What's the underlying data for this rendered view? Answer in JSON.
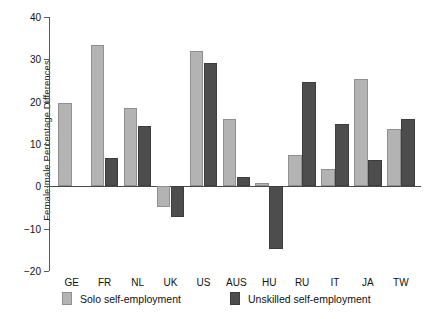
{
  "chart_data": {
    "type": "bar",
    "title": "",
    "xlabel": "",
    "ylabel": "Female-male Percentage Differences",
    "ylim": [
      -20,
      40
    ],
    "yticks": [
      -20,
      -10,
      0,
      10,
      20,
      30,
      40
    ],
    "ytick_labels": [
      "−20",
      "−10",
      "0",
      "10",
      "20",
      "30",
      "40"
    ],
    "grid": false,
    "legend_position": "bottom",
    "categories": [
      "GE",
      "FR",
      "NL",
      "UK",
      "US",
      "AUS",
      "HU",
      "RU",
      "IT",
      "JA",
      "TW"
    ],
    "series": [
      {
        "name": "Solo self-employment",
        "color": "#b3b3b3",
        "values": [
          19.6,
          33.3,
          18.4,
          -5.0,
          32.0,
          15.8,
          0.8,
          7.5,
          4.0,
          25.3,
          13.5
        ]
      },
      {
        "name": "Unskilled self-employment",
        "color": "#4d4d4d",
        "values": [
          0.0,
          6.6,
          14.2,
          -7.3,
          29.2,
          2.1,
          -14.9,
          24.7,
          14.7,
          6.3,
          15.8
        ]
      }
    ]
  },
  "legend": {
    "items": [
      {
        "label": "Solo self-employment",
        "swatch": "light"
      },
      {
        "label": "Unskilled self-employment",
        "swatch": "dark"
      }
    ]
  }
}
